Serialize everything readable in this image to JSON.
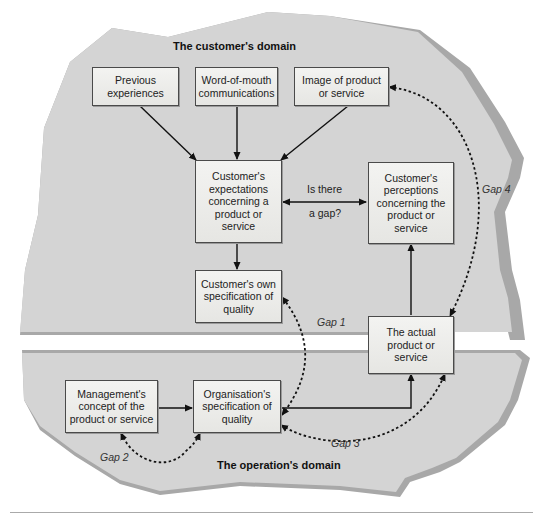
{
  "domains": {
    "customer": "The customer's domain",
    "operation": "The operation's domain"
  },
  "boxes": {
    "previous_experiences": "Previous experiences",
    "word_of_mouth": "Word-of-mouth communications",
    "image": "Image of product or service",
    "expectations": "Customer's expectations concerning a product or service",
    "perceptions": "Customer's perceptions concerning the product or service",
    "own_specification": "Customer's own specification of quality",
    "actual_product": "The actual product or service",
    "management_concept": "Management's concept of the product or service",
    "organisation_specification": "Organisation's specification of quality"
  },
  "labels": {
    "gap_question_1": "Is there",
    "gap_question_2": "a gap?"
  },
  "gaps": {
    "gap1": "Gap 1",
    "gap2": "Gap 2",
    "gap3": "Gap 3",
    "gap4": "Gap 4"
  },
  "colors": {
    "domain_fill": "#d4d4d4",
    "domain_edge": "#a9a9a9",
    "box_fill": "#ececea",
    "line": "#111111"
  }
}
